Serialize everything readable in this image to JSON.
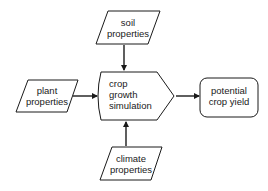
{
  "diagram": {
    "type": "flowchart",
    "nodes": {
      "soil": {
        "line1": "soil",
        "line2": "properties",
        "shape": "parallelogram"
      },
      "plant": {
        "line1": "plant",
        "line2": "properties",
        "shape": "parallelogram"
      },
      "simulation": {
        "line1": "crop",
        "line2": "growth",
        "line3": "simulation",
        "shape": "pentagon"
      },
      "climate": {
        "line1": "climate",
        "line2": "properties",
        "shape": "parallelogram"
      },
      "yield": {
        "line1": "potential",
        "line2": "crop yield",
        "shape": "rounded-rectangle"
      }
    },
    "edges": [
      {
        "from": "soil properties",
        "to": "crop growth simulation"
      },
      {
        "from": "plant properties",
        "to": "crop growth simulation"
      },
      {
        "from": "climate properties",
        "to": "crop growth simulation"
      },
      {
        "from": "crop growth simulation",
        "to": "potential crop yield"
      }
    ],
    "colors": {
      "stroke": "#1a1a1a",
      "fill": "#ffffff",
      "text": "#1a1a1a"
    }
  }
}
